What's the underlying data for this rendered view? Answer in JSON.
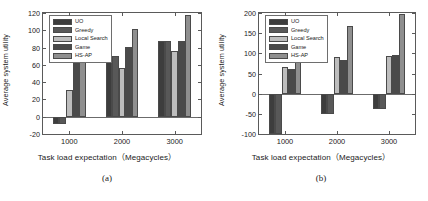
{
  "figure": {
    "panels": [
      {
        "id": "a",
        "caption": "(a)",
        "xlabel": "Task load expectation（Megacycles）",
        "ylabel": "Average system utility"
      },
      {
        "id": "b",
        "caption": "(b)",
        "xlabel": "Task load expectation（Megacycles）",
        "ylabel": "Average system utility"
      }
    ]
  },
  "legend": {
    "entries": [
      {
        "label": "UO",
        "color": "#3d3d3d"
      },
      {
        "label": "Greedy",
        "color": "#585858"
      },
      {
        "label": "Local Search",
        "color": "#bdbdbd"
      },
      {
        "label": "Game",
        "color": "#4a4a4a"
      },
      {
        "label": "HS-AP",
        "color": "#8f8f8f"
      }
    ]
  },
  "chart_data": [
    {
      "type": "bar",
      "panel": "(a)",
      "title": "",
      "xlabel": "Task load expectation（Megacycles）",
      "ylabel": "Average system utility",
      "categories": [
        "1000",
        "2000",
        "3000"
      ],
      "yticks": [
        -20,
        0,
        20,
        40,
        60,
        80,
        100,
        120
      ],
      "ylim": [
        -20,
        120
      ],
      "grid": false,
      "legend_position": "upper-left-inside",
      "series": [
        {
          "name": "UO",
          "color": "#3d3d3d",
          "values": [
            -8,
            70,
            88
          ]
        },
        {
          "name": "Greedy",
          "color": "#585858",
          "values": [
            -9,
            70,
            88
          ]
        },
        {
          "name": "Local Search",
          "color": "#bdbdbd",
          "values": [
            31,
            56,
            76
          ]
        },
        {
          "name": "Game",
          "color": "#4a4a4a",
          "values": [
            67,
            81,
            88
          ]
        },
        {
          "name": "HS-AP",
          "color": "#8f8f8f",
          "values": [
            76,
            101,
            118
          ]
        }
      ]
    },
    {
      "type": "bar",
      "panel": "(b)",
      "title": "",
      "xlabel": "Task load expectation（Megacycles）",
      "ylabel": "Average system utility",
      "categories": [
        "1000",
        "2000",
        "3000"
      ],
      "yticks": [
        -100,
        -50,
        0,
        50,
        100,
        150,
        200
      ],
      "ylim": [
        -100,
        200
      ],
      "grid": false,
      "legend_position": "upper-left-inside",
      "series": [
        {
          "name": "UO",
          "color": "#3d3d3d",
          "values": [
            -100,
            -50,
            -38
          ]
        },
        {
          "name": "Greedy",
          "color": "#585858",
          "values": [
            -100,
            -50,
            -38
          ]
        },
        {
          "name": "Local Search",
          "color": "#bdbdbd",
          "values": [
            67,
            90,
            94
          ]
        },
        {
          "name": "Game",
          "color": "#4a4a4a",
          "values": [
            61,
            83,
            97
          ]
        },
        {
          "name": "HS-AP",
          "color": "#8f8f8f",
          "values": [
            115,
            167,
            197
          ]
        }
      ]
    }
  ]
}
